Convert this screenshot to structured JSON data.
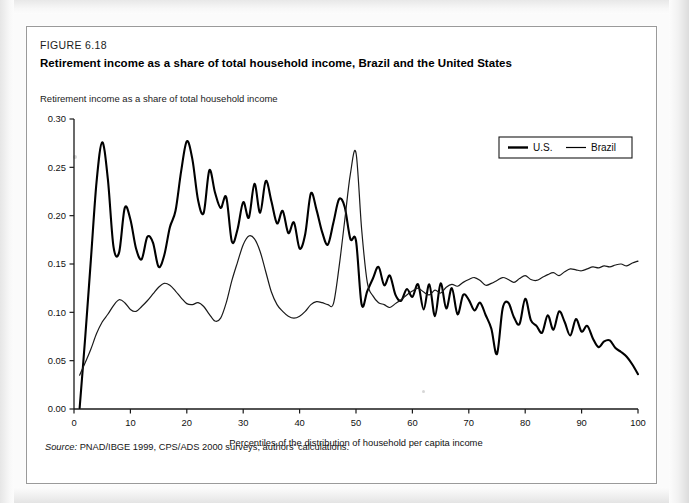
{
  "figure": {
    "number": "FIGURE 6.18",
    "title": "Retirement income as a share of total household income, Brazil and the United States",
    "source_label": "Source:",
    "source_text": "PNAD/IBGE 1999, CPS/ADS 2000 surveys; authors' calculations."
  },
  "chart_data": {
    "type": "line",
    "title": "Retirement income as a share of total household income, Brazil and the United States",
    "subtitle": "",
    "ylabel": "Retirement income as a share of total household income",
    "xlabel": "Percentiles of the distribution of household per capita income",
    "xlim": [
      0,
      100
    ],
    "ylim": [
      0.0,
      0.3
    ],
    "xticks": [
      0,
      10,
      20,
      30,
      40,
      50,
      60,
      70,
      80,
      90,
      100
    ],
    "xtick_labels": [
      "0",
      "10",
      "20",
      "30",
      "40",
      "50",
      "60",
      "70",
      "80",
      "90",
      "100"
    ],
    "yticks": [
      0.0,
      0.05,
      0.1,
      0.15,
      0.2,
      0.25,
      0.3
    ],
    "ytick_labels": [
      "0.00",
      "0.05",
      "0.10",
      "0.15",
      "0.20",
      "0.25",
      "0.30"
    ],
    "grid": false,
    "legend_position": "top-right",
    "legend_entries": [
      "U.S.",
      "Brazil"
    ],
    "colors": {
      "us": "#000000",
      "brazil": "#1a1a1a"
    },
    "x": [
      1,
      2,
      3,
      4,
      5,
      6,
      7,
      8,
      9,
      10,
      11,
      12,
      13,
      14,
      15,
      16,
      17,
      18,
      19,
      20,
      21,
      22,
      23,
      24,
      25,
      26,
      27,
      28,
      29,
      30,
      31,
      32,
      33,
      34,
      35,
      36,
      37,
      38,
      39,
      40,
      41,
      42,
      43,
      44,
      45,
      46,
      47,
      48,
      49,
      50,
      51,
      52,
      53,
      54,
      55,
      56,
      57,
      58,
      59,
      60,
      61,
      62,
      63,
      64,
      65,
      66,
      67,
      68,
      69,
      70,
      71,
      72,
      73,
      74,
      75,
      76,
      77,
      78,
      79,
      80,
      81,
      82,
      83,
      84,
      85,
      86,
      87,
      88,
      89,
      90,
      91,
      92,
      93,
      94,
      95,
      96,
      97,
      98,
      99,
      100
    ],
    "series": [
      {
        "name": "U.S.",
        "line_width": 2.1,
        "values": [
          0.001,
          0.075,
          0.155,
          0.235,
          0.276,
          0.238,
          0.168,
          0.162,
          0.208,
          0.196,
          0.166,
          0.155,
          0.178,
          0.172,
          0.147,
          0.159,
          0.188,
          0.205,
          0.246,
          0.277,
          0.258,
          0.216,
          0.203,
          0.247,
          0.224,
          0.208,
          0.219,
          0.173,
          0.186,
          0.214,
          0.198,
          0.233,
          0.203,
          0.236,
          0.215,
          0.192,
          0.205,
          0.182,
          0.193,
          0.166,
          0.181,
          0.223,
          0.206,
          0.183,
          0.17,
          0.193,
          0.217,
          0.209,
          0.176,
          0.174,
          0.108,
          0.122,
          0.135,
          0.147,
          0.128,
          0.138,
          0.118,
          0.112,
          0.124,
          0.116,
          0.129,
          0.103,
          0.129,
          0.096,
          0.13,
          0.104,
          0.125,
          0.098,
          0.118,
          0.113,
          0.102,
          0.11,
          0.097,
          0.083,
          0.057,
          0.104,
          0.11,
          0.095,
          0.088,
          0.114,
          0.092,
          0.086,
          0.079,
          0.097,
          0.082,
          0.101,
          0.09,
          0.076,
          0.093,
          0.08,
          0.086,
          0.073,
          0.064,
          0.07,
          0.071,
          0.063,
          0.059,
          0.054,
          0.046,
          0.036
        ]
      },
      {
        "name": "Brazil",
        "line_width": 1.2,
        "values": [
          0.035,
          0.048,
          0.062,
          0.078,
          0.09,
          0.098,
          0.107,
          0.113,
          0.11,
          0.103,
          0.101,
          0.106,
          0.112,
          0.119,
          0.126,
          0.13,
          0.128,
          0.122,
          0.115,
          0.109,
          0.108,
          0.11,
          0.106,
          0.098,
          0.091,
          0.094,
          0.11,
          0.133,
          0.152,
          0.17,
          0.179,
          0.176,
          0.163,
          0.142,
          0.121,
          0.108,
          0.101,
          0.096,
          0.094,
          0.096,
          0.101,
          0.108,
          0.111,
          0.11,
          0.108,
          0.109,
          0.147,
          0.195,
          0.243,
          0.265,
          0.186,
          0.131,
          0.117,
          0.11,
          0.108,
          0.105,
          0.109,
          0.113,
          0.118,
          0.122,
          0.125,
          0.121,
          0.118,
          0.123,
          0.12,
          0.126,
          0.129,
          0.127,
          0.131,
          0.134,
          0.136,
          0.133,
          0.128,
          0.13,
          0.133,
          0.136,
          0.134,
          0.131,
          0.135,
          0.138,
          0.134,
          0.133,
          0.136,
          0.139,
          0.141,
          0.138,
          0.142,
          0.145,
          0.144,
          0.143,
          0.145,
          0.147,
          0.146,
          0.148,
          0.147,
          0.149,
          0.15,
          0.148,
          0.151,
          0.153
        ]
      }
    ]
  },
  "legend": {
    "items": [
      {
        "label": "U.S.",
        "width": 2.4
      },
      {
        "label": "Brazil",
        "width": 1.2
      }
    ]
  }
}
